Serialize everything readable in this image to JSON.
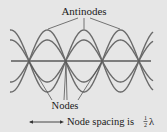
{
  "diagram": {
    "title_label": "Antinodes",
    "nodes_label": "Nodes",
    "spacing_label_prefix": "Node spacing is ",
    "spacing_fraction_num": "1",
    "spacing_fraction_den": "2",
    "spacing_symbol": "λ",
    "colors": {
      "background": "#e6e6e6",
      "wave": "#6a6a6a",
      "axis": "#5a5a5a",
      "text": "#1a1a1a",
      "leader": "#555555"
    },
    "geometry": {
      "axis_y": 61,
      "axis_x_start": 11,
      "axis_x_end": 151,
      "node_x": [
        29,
        66,
        102,
        139
      ],
      "antinode_x": [
        48,
        84,
        120
      ],
      "amplitudes": [
        31,
        21,
        -21,
        -31
      ],
      "half_wavelength_px": 36.6
    }
  }
}
